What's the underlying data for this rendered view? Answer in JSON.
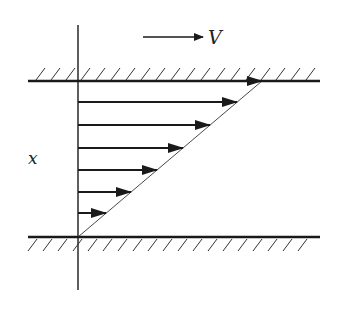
{
  "diagram": {
    "labels": {
      "velocity": "V",
      "axis": "x"
    },
    "colors": {
      "stroke": "#1a1a1a",
      "background": "#ffffff"
    },
    "geometry": {
      "top_wall_y": 81,
      "bottom_wall_y": 237,
      "axis_x": 78,
      "wall_x_start": 28,
      "wall_x_end": 320,
      "profile_top_x": 262
    },
    "velocity_arrows_y": [
      81,
      102,
      125,
      148,
      170,
      192,
      213
    ]
  }
}
